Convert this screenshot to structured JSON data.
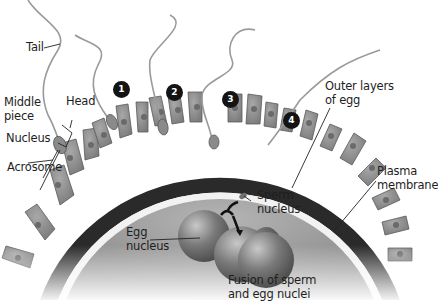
{
  "diagram": {
    "labels": {
      "tail": "Tail",
      "head": "Head",
      "middle_piece_line1": "Middle",
      "middle_piece_line2": "piece",
      "nucleus": "Nucleus",
      "acrosome": "Acrosome",
      "outer_layers_line1": "Outer layers",
      "outer_layers_line2": "of egg",
      "plasma_membrane_line1": "Plasma",
      "plasma_membrane_line2": "membrane",
      "sperm_nucleus_line1": "Sperm",
      "sperm_nucleus_line2": "nucleus",
      "egg_nucleus_line1": "Egg",
      "egg_nucleus_line2": "nucleus",
      "fusion_line1": "Fusion of sperm",
      "fusion_line2": "and egg nuclei"
    },
    "steps": [
      "1",
      "2",
      "3",
      "4"
    ],
    "colors": {
      "egg_interior": "#9a9a9a",
      "outer_dark_layer": "#2a2a2a",
      "membrane_white": "#f2f2f2",
      "cell_fill": "#8e8e8e",
      "step_badge": "#141414"
    }
  }
}
